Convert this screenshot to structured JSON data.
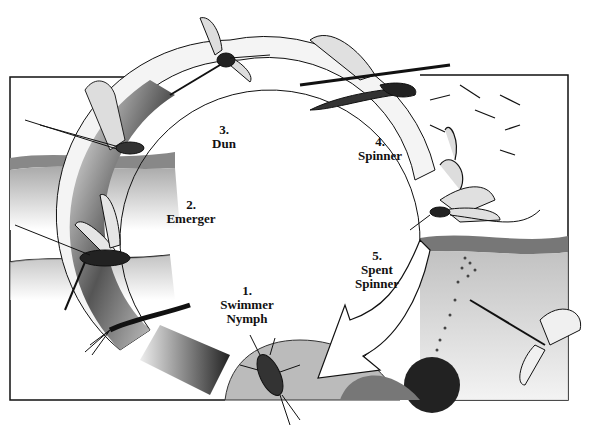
{
  "diagram": {
    "type": "life-cycle",
    "colors": {
      "ink": "#111111",
      "paper": "#ffffff",
      "ring_shade": "#444444",
      "water": "#cfcfcf"
    },
    "stages": [
      {
        "number": "1.",
        "name": "Swimmer",
        "name2": "Nymph"
      },
      {
        "number": "2.",
        "name": "Emerger",
        "name2": ""
      },
      {
        "number": "3.",
        "name": "Dun",
        "name2": ""
      },
      {
        "number": "4.",
        "name": "Spinner",
        "name2": ""
      },
      {
        "number": "5.",
        "name": "Spent",
        "name2": "Spinner"
      }
    ]
  }
}
